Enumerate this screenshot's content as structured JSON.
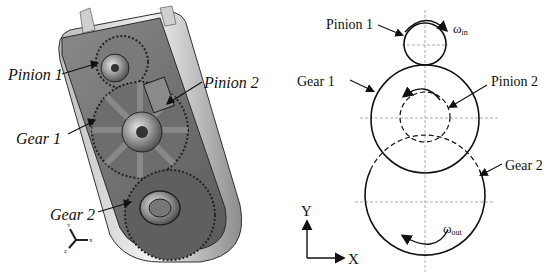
{
  "left_figure": {
    "description": "3D CAD render of two-stage gearbox housing",
    "labels": {
      "pinion1": "Pinion 1",
      "pinion2": "Pinion 2",
      "gear1": "Gear 1",
      "gear2": "Gear 2"
    },
    "triad": {
      "x": "X",
      "y": "Y",
      "z": "Z"
    }
  },
  "right_figure": {
    "labels": {
      "pinion1": "Pinion 1",
      "pinion2": "Pinion 2",
      "gear1": "Gear 1",
      "gear2": "Gear 2"
    },
    "omega_in": {
      "base": "ω",
      "sub": "in"
    },
    "omega_out": {
      "base": "ω",
      "sub": "out"
    },
    "axes": {
      "x": "X",
      "y": "Y"
    }
  },
  "colors": {
    "line": "#111111",
    "dash": "#555555",
    "metal_light": "#d8d8d8",
    "metal_mid": "#9a9a9a",
    "metal_dark": "#4a4a4a"
  }
}
